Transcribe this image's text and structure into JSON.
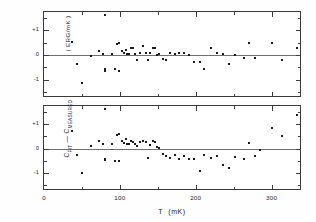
{
  "chart_data": [
    {
      "type": "scatter",
      "panel": "top",
      "title": "",
      "xlabel": "T (mK)",
      "ylabel": "( ERG/mK )",
      "xlim": [
        0,
        340
      ],
      "ylim": [
        -1.75,
        1.75
      ],
      "xticks": [
        0,
        100,
        200,
        300
      ],
      "xtick_labels": [
        "0",
        "100",
        "200",
        "300"
      ],
      "xminor_ticks": [
        50,
        150,
        250
      ],
      "yticks": [
        -1,
        0,
        1
      ],
      "ytick_labels": [
        "-1",
        "0",
        "+1"
      ],
      "yminor_ticks": [
        -1.5,
        -0.5,
        0.5,
        1.5
      ],
      "grid": false,
      "legend": "none",
      "zero_reference_line": 0,
      "points": [
        [
          37,
          0.52
        ],
        [
          43,
          -0.38
        ],
        [
          50,
          -1.13
        ],
        [
          62,
          -0.03
        ],
        [
          72,
          0.17
        ],
        [
          78,
          0.05
        ],
        [
          81,
          1.62
        ],
        [
          81,
          -0.56
        ],
        [
          81,
          -0.64
        ],
        [
          90,
          0.05
        ],
        [
          93,
          -0.58
        ],
        [
          96,
          0.43
        ],
        [
          99,
          0.48
        ],
        [
          99,
          -0.66
        ],
        [
          103,
          0.17
        ],
        [
          106,
          0.1
        ],
        [
          108,
          0.2
        ],
        [
          110,
          0.05
        ],
        [
          112,
          0.04
        ],
        [
          115,
          0.3
        ],
        [
          117,
          0.3
        ],
        [
          120,
          0.05
        ],
        [
          122,
          -0.2
        ],
        [
          126,
          0.1
        ],
        [
          131,
          0.35
        ],
        [
          134,
          0.08
        ],
        [
          137,
          -0.22
        ],
        [
          140,
          0.1
        ],
        [
          143,
          0.3
        ],
        [
          146,
          0.28
        ],
        [
          149,
          0.02
        ],
        [
          152,
          0.04
        ],
        [
          157,
          -0.18
        ],
        [
          161,
          -0.2
        ],
        [
          166,
          0.07
        ],
        [
          172,
          0.03
        ],
        [
          178,
          0.1
        ],
        [
          184,
          0.1
        ],
        [
          191,
          -0.02
        ],
        [
          198,
          -0.3
        ],
        [
          205,
          -0.28
        ],
        [
          211,
          -0.55
        ],
        [
          220,
          0.3
        ],
        [
          228,
          0.07
        ],
        [
          236,
          0.06
        ],
        [
          244,
          -0.38
        ],
        [
          252,
          0.02
        ],
        [
          264,
          -0.12
        ],
        [
          270,
          0.5
        ],
        [
          278,
          -0.12
        ],
        [
          300,
          0.5
        ],
        [
          313,
          -0.2
        ],
        [
          333,
          0.3
        ]
      ]
    },
    {
      "type": "scatter",
      "panel": "bottom",
      "title": "",
      "xlabel": "T (mK)",
      "ylabel": "C_FIT - C_MEASURED",
      "xlim": [
        0,
        340
      ],
      "ylim": [
        -1.75,
        1.75
      ],
      "xticks": [
        0,
        100,
        200,
        300
      ],
      "xtick_labels": [
        "0",
        "100",
        "200",
        "300"
      ],
      "xminor_ticks": [
        50,
        150,
        250
      ],
      "yticks": [
        -1,
        0,
        1
      ],
      "ytick_labels": [
        "-1",
        "0",
        "+1"
      ],
      "yminor_ticks": [
        -1.5,
        -0.5,
        0.5,
        1.5
      ],
      "grid": false,
      "legend": "none",
      "zero_reference_line": 0,
      "points": [
        [
          37,
          0.72
        ],
        [
          43,
          -0.27
        ],
        [
          50,
          -1.0
        ],
        [
          62,
          0.1
        ],
        [
          72,
          0.3
        ],
        [
          78,
          0.18
        ],
        [
          81,
          1.62
        ],
        [
          81,
          -0.42
        ],
        [
          81,
          -0.48
        ],
        [
          90,
          0.2
        ],
        [
          93,
          -0.52
        ],
        [
          96,
          0.55
        ],
        [
          99,
          0.58
        ],
        [
          99,
          -0.52
        ],
        [
          103,
          0.3
        ],
        [
          106,
          0.22
        ],
        [
          108,
          0.4
        ],
        [
          110,
          0.2
        ],
        [
          112,
          0.18
        ],
        [
          115,
          0.32
        ],
        [
          117,
          0.25
        ],
        [
          120,
          0.18
        ],
        [
          122,
          0.1
        ],
        [
          126,
          0.28
        ],
        [
          131,
          0.3
        ],
        [
          134,
          0.28
        ],
        [
          137,
          -0.38
        ],
        [
          140,
          0.15
        ],
        [
          143,
          0.3
        ],
        [
          146,
          0.26
        ],
        [
          149,
          0.05
        ],
        [
          152,
          0.02
        ],
        [
          157,
          -0.22
        ],
        [
          161,
          -0.3
        ],
        [
          166,
          -0.4
        ],
        [
          172,
          -0.26
        ],
        [
          178,
          -0.42
        ],
        [
          184,
          -0.3
        ],
        [
          191,
          -0.45
        ],
        [
          198,
          -0.42
        ],
        [
          205,
          -0.92
        ],
        [
          211,
          -0.25
        ],
        [
          220,
          -0.38
        ],
        [
          228,
          -0.3
        ],
        [
          236,
          -0.68
        ],
        [
          244,
          -0.8
        ],
        [
          252,
          -0.35
        ],
        [
          264,
          -0.42
        ],
        [
          270,
          0.22
        ],
        [
          278,
          -0.3
        ],
        [
          284,
          -0.08
        ],
        [
          300,
          0.85
        ],
        [
          313,
          0.5
        ],
        [
          333,
          1.4
        ]
      ]
    }
  ],
  "axes": {
    "top_panel": {
      "ytick_labels": [
        "+1",
        "0",
        "-1"
      ],
      "ytitle": "( ERG/mK )"
    },
    "bottom_panel": {
      "ytick_labels": [
        "+1",
        "0",
        "-1"
      ],
      "ytitle_main1": "C",
      "ytitle_sub1": "FIT",
      "ytitle_dash": " — ",
      "ytitle_main2": "C",
      "ytitle_sub2": "MEASURED"
    },
    "xtick_labels": [
      "0",
      "100",
      "200",
      "300"
    ],
    "xtitle_symbol": "T",
    "xtitle_units": "(mK)"
  }
}
